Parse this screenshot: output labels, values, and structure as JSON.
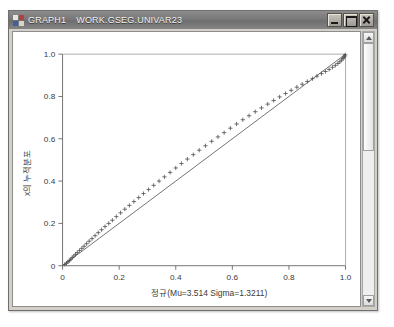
{
  "window": {
    "title_app": "GRAPH1",
    "title_dataset": "WORK.GSEG.UNIVAR23",
    "icon": "sas-graph-icon",
    "buttons": {
      "minimize": "Minimize",
      "maximize": "Maximize",
      "close": "Close"
    }
  },
  "scrollbar": {
    "up": "scroll-up",
    "down": "scroll-down",
    "thumb": "scroll-thumb"
  },
  "chart_data": {
    "type": "scatter",
    "title": "",
    "subtitle": "",
    "xlabel": "정규(Mu=3.514 Sigma=1.3211)",
    "ylabel": "x의 누적분포",
    "xlim": [
      0,
      1.0
    ],
    "ylim": [
      0,
      1.0
    ],
    "xticks": [
      0,
      0.2,
      0.4,
      0.6,
      0.8,
      1.0
    ],
    "xticklabels": [
      "0",
      "0.2",
      "0.4",
      "0.6",
      "0.8",
      "1.0"
    ],
    "yticks": [
      0,
      0.2,
      0.4,
      0.6,
      0.8,
      1.0
    ],
    "yticklabels": [
      "0",
      "0.2",
      "0.4",
      "0.6",
      "0.8",
      "1.0"
    ],
    "grid": false,
    "legend": null,
    "marker": "plus",
    "marker_color": "#4a4a4a",
    "reference_line": {
      "name": "diagonal-reference-line",
      "from": [
        0,
        0
      ],
      "to": [
        1.0,
        1.0
      ],
      "color": "#555555"
    },
    "series": [
      {
        "name": "P-P plot points",
        "x": [
          0.008,
          0.014,
          0.019,
          0.024,
          0.029,
          0.034,
          0.04,
          0.046,
          0.052,
          0.06,
          0.068,
          0.076,
          0.085,
          0.094,
          0.104,
          0.115,
          0.126,
          0.138,
          0.15,
          0.163,
          0.176,
          0.19,
          0.205,
          0.22,
          0.236,
          0.252,
          0.269,
          0.286,
          0.304,
          0.322,
          0.341,
          0.36,
          0.38,
          0.4,
          0.42,
          0.441,
          0.462,
          0.483,
          0.505,
          0.527,
          0.549,
          0.571,
          0.593,
          0.615,
          0.637,
          0.659,
          0.681,
          0.703,
          0.725,
          0.746,
          0.767,
          0.788,
          0.808,
          0.828,
          0.847,
          0.865,
          0.883,
          0.899,
          0.915,
          0.929,
          0.942,
          0.954,
          0.964,
          0.973,
          0.98,
          0.986,
          0.991,
          0.994,
          0.997,
          0.999
        ],
        "y": [
          0.006,
          0.012,
          0.018,
          0.024,
          0.031,
          0.038,
          0.046,
          0.054,
          0.062,
          0.072,
          0.082,
          0.092,
          0.104,
          0.116,
          0.128,
          0.142,
          0.156,
          0.17,
          0.185,
          0.2,
          0.215,
          0.232,
          0.25,
          0.267,
          0.285,
          0.303,
          0.322,
          0.341,
          0.36,
          0.38,
          0.4,
          0.42,
          0.441,
          0.462,
          0.483,
          0.504,
          0.525,
          0.546,
          0.567,
          0.588,
          0.609,
          0.629,
          0.65,
          0.67,
          0.69,
          0.709,
          0.728,
          0.746,
          0.764,
          0.781,
          0.798,
          0.814,
          0.829,
          0.844,
          0.858,
          0.871,
          0.884,
          0.896,
          0.908,
          0.918,
          0.928,
          0.938,
          0.947,
          0.956,
          0.964,
          0.972,
          0.979,
          0.985,
          0.991,
          0.997
        ]
      }
    ]
  }
}
